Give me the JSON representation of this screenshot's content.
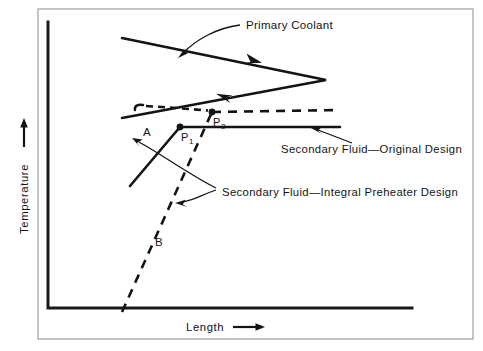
{
  "figure": {
    "background_color": "#ffffff",
    "ink_color": "#141414",
    "frame_color": "#8c8c8c"
  },
  "axes": {
    "y_axis_title": "Temperature",
    "x_axis_title": "Length",
    "y_axis_arrow": "up-arrow",
    "x_axis_arrow": "right-arrow",
    "origin": {
      "x": 48,
      "y": 308
    },
    "x_end": {
      "x": 412,
      "y": 308
    },
    "y_top": {
      "x": 48,
      "y": 22
    },
    "ticks": [],
    "grid": false
  },
  "annotations": {
    "primary_coolant": "Primary Coolant",
    "secondary_original": "Secondary Fluid—Original Design",
    "secondary_preheater": "Secondary Fluid—Integral Preheater Design",
    "label_a": "A",
    "label_b": "B",
    "point_1_base": "P",
    "point_1_sub": "1",
    "point_2_base": "P",
    "point_2_sub": "2"
  },
  "chart_data": {
    "type": "line",
    "title": "",
    "xlabel": "Length",
    "ylabel": "Temperature",
    "xlim": [
      48,
      412
    ],
    "ylim": [
      308,
      22
    ],
    "grid": false,
    "legend": "inline-annotations",
    "series": [
      {
        "name": "Primary Coolant",
        "style": "solid",
        "description": "Hot primary coolant traverses the heat exchanger and returns, forming a V pointing right",
        "points": [
          {
            "x": 122,
            "y": 38
          },
          {
            "x": 326,
            "y": 80
          },
          {
            "x": 122,
            "y": 118
          }
        ],
        "flow_arrows": [
          {
            "x": 248,
            "y": 59,
            "direction": "down-right"
          },
          {
            "x": 232,
            "y": 97,
            "direction": "up-left"
          }
        ]
      },
      {
        "name": "Secondary Fluid—Original Design",
        "style": "solid",
        "description": "Secondary fluid heats from inlet up to P1 then stays at constant boiling temperature",
        "points": [
          {
            "x": 130,
            "y": 186
          },
          {
            "x": 180,
            "y": 127
          },
          {
            "x": 340,
            "y": 127
          }
        ],
        "marker_points": [
          {
            "label": "P1",
            "x": 180,
            "y": 127
          }
        ]
      },
      {
        "name": "Secondary Fluid—Integral Preheater Design",
        "style": "dashed",
        "description": "Integral preheater design: longer preheat ramp from B reaching P2 at a higher temperature, then constant",
        "points": [
          {
            "x": 122,
            "y": 312
          },
          {
            "x": 212,
            "y": 112
          },
          {
            "x": 340,
            "y": 110
          }
        ],
        "marker_points": [
          {
            "label": "P2",
            "x": 212,
            "y": 112
          }
        ]
      }
    ],
    "labeled_regions": [
      {
        "label": "A",
        "x": 147,
        "y": 132,
        "refers_to": "original-design preheat segment"
      },
      {
        "label": "B",
        "x": 157,
        "y": 242,
        "refers_to": "integral-preheater preheat segment"
      }
    ],
    "callouts": [
      {
        "text": "Primary Coolant",
        "text_x": 246,
        "text_y": 29,
        "arrow_tip": {
          "x": 179,
          "y": 56
        },
        "arrow_tail": {
          "x": 240,
          "y": 25
        }
      },
      {
        "text": "Secondary Fluid—Original Design",
        "text_x": 281,
        "text_y": 153,
        "arrow_tip": {
          "x": 312,
          "y": 131
        },
        "arrow_tail": {
          "x": 352,
          "y": 143
        }
      },
      {
        "text": "Secondary Fluid—Integral Preheater Design",
        "text_x": 222,
        "text_y": 192,
        "arrow_tips": [
          {
            "x": 133,
            "y": 141
          },
          {
            "x": 176,
            "y": 203
          }
        ]
      }
    ]
  }
}
